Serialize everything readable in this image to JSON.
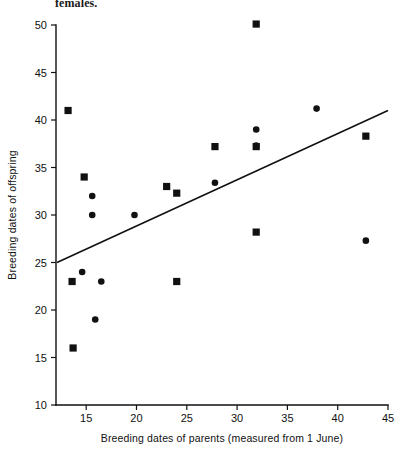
{
  "caption": {
    "text_fragment": "females."
  },
  "chart_data": {
    "type": "scatter",
    "title": "",
    "xlabel": "Breeding dates of parents (measured from 1 June)",
    "ylabel": "Breeding dates of offspring",
    "xlim": [
      12,
      45
    ],
    "ylim": [
      10,
      50
    ],
    "xticks": [
      15,
      20,
      25,
      30,
      35,
      40,
      45
    ],
    "yticks": [
      10,
      15,
      20,
      25,
      30,
      35,
      40,
      45,
      50
    ],
    "grid": false,
    "legend": "none",
    "series": [
      {
        "name": "squares",
        "marker": "square",
        "points": [
          {
            "x": 13.2,
            "y": 41.0
          },
          {
            "x": 14.8,
            "y": 34.0
          },
          {
            "x": 13.6,
            "y": 23.0
          },
          {
            "x": 13.7,
            "y": 16.0
          },
          {
            "x": 23.0,
            "y": 33.0
          },
          {
            "x": 24.0,
            "y": 32.3
          },
          {
            "x": 24.0,
            "y": 23.0
          },
          {
            "x": 27.8,
            "y": 37.2
          },
          {
            "x": 31.9,
            "y": 50.1
          },
          {
            "x": 31.9,
            "y": 37.2
          },
          {
            "x": 31.9,
            "y": 28.2
          },
          {
            "x": 42.8,
            "y": 38.3
          }
        ]
      },
      {
        "name": "circles",
        "marker": "circle",
        "points": [
          {
            "x": 15.6,
            "y": 32.0
          },
          {
            "x": 15.6,
            "y": 30.0
          },
          {
            "x": 19.8,
            "y": 30.0
          },
          {
            "x": 14.6,
            "y": 24.0
          },
          {
            "x": 16.5,
            "y": 23.0
          },
          {
            "x": 15.9,
            "y": 19.0
          },
          {
            "x": 27.8,
            "y": 33.4
          },
          {
            "x": 31.9,
            "y": 39.0
          },
          {
            "x": 31.9,
            "y": 37.3
          },
          {
            "x": 37.9,
            "y": 41.2
          },
          {
            "x": 42.8,
            "y": 27.3
          }
        ]
      }
    ],
    "fit_line": {
      "name": "regression-line",
      "x_start": 12.1,
      "y_start": 25.0,
      "x_end": 45.0,
      "y_end": 41.0
    }
  },
  "colors": {
    "ink": "#111111",
    "background": "#ffffff"
  }
}
